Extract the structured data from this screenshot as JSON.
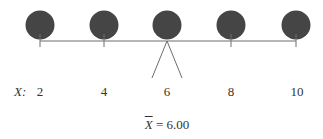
{
  "diagram": {
    "axis_label": "X:",
    "points": [
      {
        "value": "2",
        "x": 40
      },
      {
        "value": "4",
        "x": 104
      },
      {
        "value": "6",
        "x": 167
      },
      {
        "value": "8",
        "x": 231
      },
      {
        "value": "10",
        "x": 296
      }
    ],
    "mean_symbol": "X",
    "mean_text": " = 6.00",
    "colors": {
      "ball": "#454545",
      "line": "#6e6e6e",
      "text": "#333333"
    }
  }
}
